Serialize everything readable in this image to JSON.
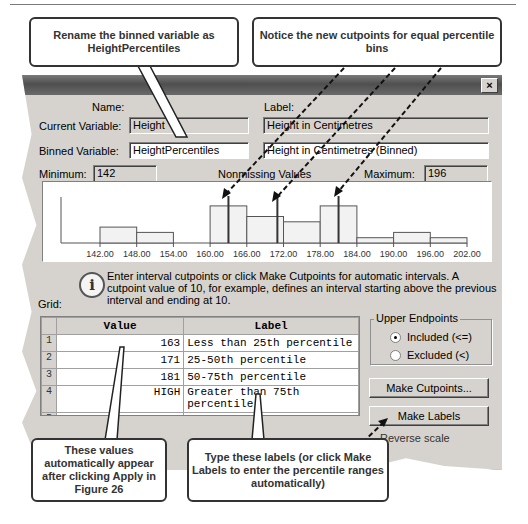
{
  "callouts": {
    "rename": "Rename the binned variable as HeightPercentiles",
    "cutpoints": "Notice the new cutpoints for equal percentile bins",
    "values": "These values automatically appear after clicking Apply in Figure 26",
    "labels": "Type these labels (or click Make Labels to enter the percentile ranges automatically)"
  },
  "dialog": {
    "close_label": "×",
    "name_header": "Name:",
    "label_header": "Label:",
    "current_variable": {
      "label": "Current Variable:",
      "name": "Height",
      "var_label": "Height in Centimetres"
    },
    "binned_variable": {
      "label": "Binned Variable:",
      "name": "HeightPercentiles",
      "var_label": "Height in Centimetres (Binned)"
    },
    "minimum": {
      "label": "Minimum:",
      "value": "142"
    },
    "nonmissing_label": "Nonmissing Values",
    "maximum": {
      "label": "Maximum:",
      "value": "196"
    },
    "info_icon": "i",
    "info_text": "Enter interval cutpoints or click Make Cutpoints for automatic intervals.  A cutpoint value of 10, for example, defines an interval starting above the previous interval and ending at 10.",
    "grid_label": "Grid:",
    "grid": {
      "columns": [
        "Value",
        "Label"
      ],
      "rows": [
        {
          "num": "1",
          "value": "163",
          "label": "Less than 25th percentile"
        },
        {
          "num": "2",
          "value": "171",
          "label": "25-50th percentile"
        },
        {
          "num": "3",
          "value": "181",
          "label": "50-75th percentile"
        },
        {
          "num": "4",
          "value": "HIGH",
          "label": "Greater than 75th percentile"
        },
        {
          "num": "5",
          "value": "",
          "label": ""
        }
      ]
    },
    "upper_endpoints": {
      "title": "Upper Endpoints",
      "options": [
        {
          "label": "Included (<=)",
          "selected": true
        },
        {
          "label": "Excluded (<)",
          "selected": false
        }
      ]
    },
    "make_cutpoints_label": "Make Cutpoints...",
    "make_labels_label": "Make Labels",
    "reverse_scale_label": "Reverse scale"
  },
  "chart_data": {
    "type": "bar",
    "title": "",
    "xlabel": "",
    "ylabel": "",
    "categories": [
      "142-148",
      "148-154",
      "154-160",
      "160-166",
      "166-172",
      "172-178",
      "178-184",
      "184-190",
      "190-196",
      "196-202"
    ],
    "tick_labels": [
      "142.00",
      "148.00",
      "154.00",
      "160.00",
      "166.00",
      "172.00",
      "178.00",
      "184.00",
      "190.00",
      "196.00",
      "202.00"
    ],
    "values": [
      3,
      2,
      0,
      7,
      5,
      4,
      7,
      1,
      2,
      1
    ],
    "cutpoints": [
      163,
      171,
      181
    ],
    "xlim": [
      136,
      202
    ],
    "grid": false,
    "legend": "none"
  }
}
